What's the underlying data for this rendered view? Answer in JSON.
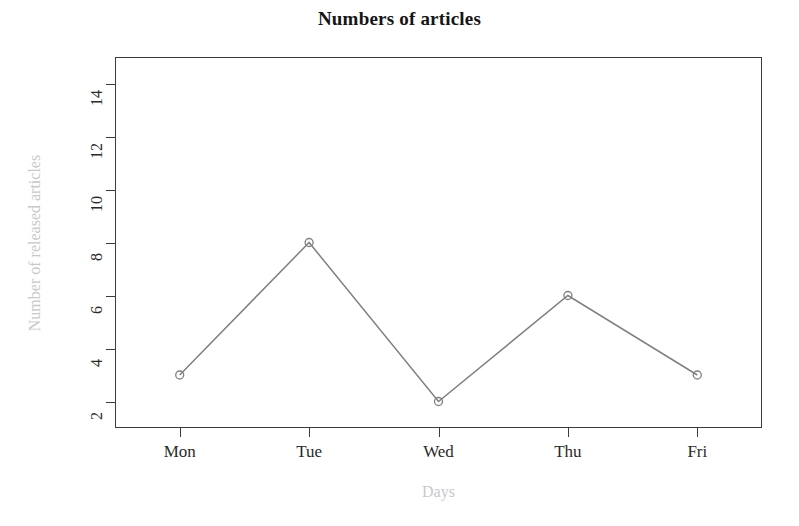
{
  "chart_data": {
    "type": "line",
    "title": "Numbers of articles",
    "xlabel": "Days",
    "ylabel": "Number of released articles",
    "categories": [
      "Mon",
      "Tue",
      "Wed",
      "Thu",
      "Fri"
    ],
    "values": [
      3,
      8,
      2,
      6,
      3
    ],
    "series": [
      {
        "name": "Number of released articles",
        "values": [
          3,
          8,
          2,
          6,
          3
        ]
      }
    ],
    "ylim": [
      1,
      15
    ],
    "yticks": [
      2,
      4,
      6,
      8,
      10,
      12,
      14
    ],
    "ytick_labels": [
      "2",
      "4",
      "6",
      "8",
      "10",
      "12",
      "14"
    ],
    "xticks": [
      "Mon",
      "Tue",
      "Wed",
      "Thu",
      "Fri"
    ],
    "grid": false,
    "legend": false,
    "legend_position": "none",
    "marker": "open-circle",
    "line_color": "#808080",
    "marker_color": "#808080",
    "axis_color": "#3b3b3b",
    "title_color": "#151515",
    "axis_title_color": "#c9c9c9",
    "background": "#ffffff"
  }
}
